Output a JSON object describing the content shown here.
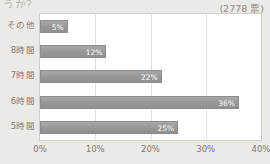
{
  "header": {
    "question": "うか？",
    "vote_count": "(2778 票)"
  },
  "chart_data": {
    "type": "bar",
    "orientation": "horizontal",
    "title": "",
    "subtitle": "",
    "xlabel": "",
    "ylabel": "",
    "categories": [
      "その他",
      "8時間",
      "7時間",
      "6時間",
      "5時間"
    ],
    "values": [
      5,
      12,
      22,
      36,
      25
    ],
    "data_labels": [
      "5%",
      "12%",
      "22%",
      "36%",
      "25%"
    ],
    "xlim": [
      0,
      40
    ],
    "xticks": [
      0,
      10,
      20,
      30,
      40
    ],
    "xtick_labels": [
      "0%",
      "10%",
      "20%",
      "30%",
      "40%"
    ],
    "grid": true,
    "legend": false,
    "bar_color": "#9c9c9c",
    "plot_background": "#ffffff",
    "page_background": "#eceae6"
  }
}
